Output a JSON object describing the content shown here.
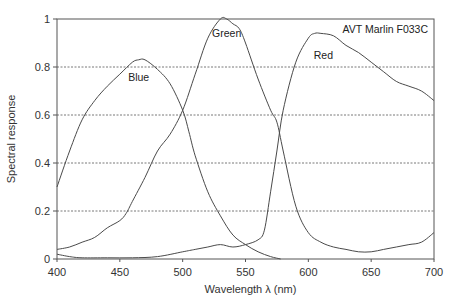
{
  "chart_data": {
    "type": "line",
    "title": "",
    "annotation": "AVT Marlin F033C",
    "xlabel": "Wavelength λ (nm)",
    "ylabel": "Spectral response",
    "xlim": [
      400,
      700
    ],
    "ylim": [
      0,
      1
    ],
    "x_ticks": [
      400,
      450,
      500,
      550,
      600,
      650,
      700
    ],
    "y_ticks": [
      0,
      0.2,
      0.4,
      0.6,
      0.8,
      1
    ],
    "y_tick_labels": [
      "0",
      "0.2",
      "0.4",
      "0.6",
      "0.8",
      "1"
    ],
    "grid": "horizontal dotted",
    "series": [
      {
        "name": "Blue",
        "label_at": [
          465,
          0.76
        ],
        "x": [
          400,
          410,
          420,
          430,
          440,
          450,
          460,
          465,
          470,
          480,
          490,
          500,
          505,
          510,
          520,
          530,
          540,
          550,
          560,
          570,
          578
        ],
        "values": [
          0.3,
          0.45,
          0.58,
          0.66,
          0.72,
          0.77,
          0.82,
          0.83,
          0.83,
          0.79,
          0.73,
          0.62,
          0.53,
          0.43,
          0.28,
          0.18,
          0.1,
          0.06,
          0.03,
          0.01,
          0.0
        ]
      },
      {
        "name": "Green",
        "label_at": [
          535,
          0.94
        ],
        "x": [
          400,
          410,
          420,
          430,
          440,
          450,
          455,
          460,
          470,
          480,
          490,
          500,
          510,
          520,
          530,
          535,
          540,
          545,
          550,
          560,
          570,
          575,
          580,
          590,
          600,
          610,
          620,
          630,
          640,
          650,
          660,
          670,
          680,
          690,
          700
        ],
        "values": [
          0.04,
          0.05,
          0.07,
          0.09,
          0.13,
          0.16,
          0.19,
          0.24,
          0.34,
          0.45,
          0.52,
          0.62,
          0.77,
          0.92,
          1.0,
          1.0,
          0.98,
          0.96,
          0.9,
          0.75,
          0.62,
          0.57,
          0.45,
          0.22,
          0.11,
          0.07,
          0.05,
          0.04,
          0.03,
          0.03,
          0.04,
          0.05,
          0.06,
          0.07,
          0.11
        ]
      },
      {
        "name": "Red",
        "label_at": [
          612,
          0.85
        ],
        "x": [
          400,
          410,
          420,
          440,
          460,
          480,
          500,
          510,
          520,
          530,
          540,
          550,
          560,
          565,
          570,
          575,
          580,
          590,
          600,
          605,
          610,
          620,
          630,
          640,
          650,
          660,
          670,
          680,
          690,
          700
        ],
        "values": [
          0.02,
          0.01,
          0.005,
          0.005,
          0.005,
          0.01,
          0.03,
          0.04,
          0.05,
          0.06,
          0.05,
          0.06,
          0.08,
          0.12,
          0.28,
          0.45,
          0.62,
          0.82,
          0.92,
          0.94,
          0.94,
          0.93,
          0.89,
          0.86,
          0.82,
          0.78,
          0.74,
          0.72,
          0.7,
          0.66
        ]
      }
    ]
  }
}
